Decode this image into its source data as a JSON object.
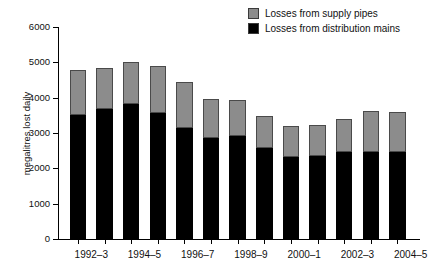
{
  "chart_data": {
    "type": "bar",
    "subtype": "stacked-bar",
    "title": "",
    "xlabel": "",
    "ylabel": "megalitres lost daily",
    "ylim": [
      0,
      6000
    ],
    "yticks": [
      0,
      1000,
      2000,
      3000,
      4000,
      5000,
      6000
    ],
    "grid": false,
    "legend_position": "top-right",
    "categories": [
      "1992–3",
      "1993–4",
      "1994–5",
      "1995–6",
      "1996–7",
      "1997–8",
      "1998–9",
      "1999–0",
      "2000–1",
      "2001–2",
      "2002–3",
      "2003–4",
      "2004–5"
    ],
    "xtick_labels": [
      "1992–3",
      "1994–5",
      "1996–7",
      "1998–9",
      "2000–1",
      "2002–3",
      "2004–5"
    ],
    "series": [
      {
        "name": "Losses from distribution mains",
        "color": "#000000",
        "values": [
          3510,
          3680,
          3820,
          3570,
          3140,
          2850,
          2920,
          2570,
          2320,
          2350,
          2460,
          2470,
          2460
        ]
      },
      {
        "name": "Losses from supply pipes",
        "color": "#8c8c8c",
        "values": [
          1260,
          1170,
          1200,
          1330,
          1290,
          1100,
          1010,
          910,
          880,
          880,
          940,
          1150,
          1140
        ]
      }
    ],
    "totals": [
      4770,
      4850,
      5020,
      4900,
      4430,
      3950,
      3930,
      3480,
      3200,
      3230,
      3400,
      3620,
      3600
    ]
  },
  "legend": {
    "items": [
      {
        "label": "Losses from supply pipes",
        "swatch": "supply"
      },
      {
        "label": "Losses from distribution mains",
        "swatch": "mains"
      }
    ]
  },
  "axis": {
    "y_title": "megalitres lost daily",
    "y_tick_labels": [
      "6000",
      "5000",
      "4000",
      "3000",
      "2000",
      "1000",
      "0"
    ]
  }
}
